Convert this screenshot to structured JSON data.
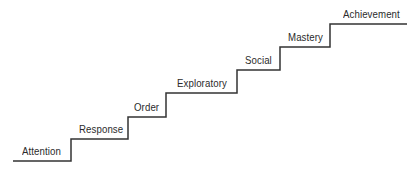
{
  "diagram": {
    "type": "staircase",
    "line_color": "#333333",
    "text_color": "#2b2b2b",
    "steps": [
      {
        "label": "Attention",
        "x1": 13,
        "x2": 71,
        "y": 161,
        "label_x": 22
      },
      {
        "label": "Response",
        "x1": 71,
        "x2": 128,
        "y": 139,
        "label_x": 79
      },
      {
        "label": "Order",
        "x1": 128,
        "x2": 166,
        "y": 117,
        "label_x": 134
      },
      {
        "label": "Exploratory",
        "x1": 166,
        "x2": 237,
        "y": 93,
        "label_x": 177
      },
      {
        "label": "Social",
        "x1": 237,
        "x2": 280,
        "y": 70,
        "label_x": 245
      },
      {
        "label": "Mastery",
        "x1": 280,
        "x2": 330,
        "y": 47,
        "label_x": 288
      },
      {
        "label": "Achievement",
        "x1": 330,
        "x2": 407,
        "y": 24,
        "label_x": 343
      }
    ]
  }
}
